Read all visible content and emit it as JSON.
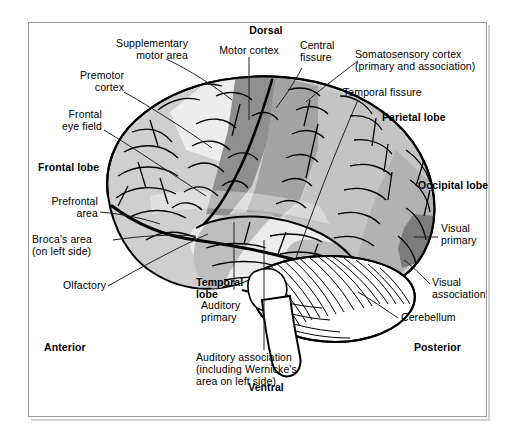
{
  "figure": {
    "frame_color": "#9a9a9a",
    "background": "#ffffff"
  },
  "orientation_labels": {
    "dorsal": "Dorsal",
    "ventral": "Ventral",
    "anterior": "Anterior",
    "posterior": "Posterior"
  },
  "lobe_labels": {
    "frontal": "Frontal lobe",
    "parietal": "Parietal lobe",
    "occipital": "Occipital lobe",
    "temporal": "Temporal\nlobe"
  },
  "callouts": [
    {
      "id": "supplementary-motor-area",
      "text": "Supplementary\nmotor area"
    },
    {
      "id": "premotor-cortex",
      "text": "Premotor\ncortex"
    },
    {
      "id": "frontal-eye-field",
      "text": "Frontal\neye field"
    },
    {
      "id": "prefrontal-area",
      "text": "Prefrontal\narea"
    },
    {
      "id": "brocas-area",
      "text": "Broca's area\n(on left side)"
    },
    {
      "id": "olfactory",
      "text": "Olfactory"
    },
    {
      "id": "motor-cortex",
      "text": "Motor cortex"
    },
    {
      "id": "central-fissure",
      "text": "Central\nfissure"
    },
    {
      "id": "somatosensory-cortex",
      "text": "Somatosensory cortex\n(primary and association)"
    },
    {
      "id": "temporal-fissure",
      "text": "Temporal fissure"
    },
    {
      "id": "visual-primary",
      "text": "Visual\nprimary"
    },
    {
      "id": "visual-association",
      "text": "Visual\nassociation"
    },
    {
      "id": "cerebellum",
      "text": "Cerebellum"
    },
    {
      "id": "auditory-primary",
      "text": "Auditory\nprimary"
    },
    {
      "id": "auditory-association",
      "text": "Auditory association\n(including Wernicke's\narea on left side)"
    }
  ],
  "region_shading": {
    "frontal_light": "#cfcfcf",
    "supplementary_motor_pale": "#eeeeee",
    "motor_cortex_dark": "#8f8f8f",
    "somatosensory_mid": "#a8a8a8",
    "parietal_light": "#c6c6c6",
    "temporal_pale": "#ececec",
    "auditory_mid": "#b9b9b9",
    "occipital_mid": "#b0b0b0",
    "visual_primary_dark": "#7d7d7d",
    "cerebellum": "#ffffff",
    "outline": "#000000"
  }
}
